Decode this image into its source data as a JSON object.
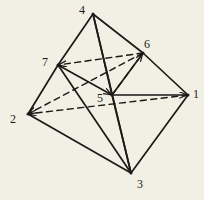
{
  "figure": {
    "name": "polyhedron-wireframe-diagram",
    "background_color": "#f2efe4",
    "ink_color": "#1a1a18",
    "canvas": {
      "width": 204,
      "height": 200
    },
    "vertices": [
      {
        "id": "1",
        "label": "1",
        "x": 188,
        "y": 95,
        "label_x": 193,
        "label_y": 88
      },
      {
        "id": "2",
        "label": "2",
        "x": 28,
        "y": 114,
        "label_x": 10,
        "label_y": 113
      },
      {
        "id": "3",
        "label": "3",
        "x": 131,
        "y": 173,
        "label_x": 137,
        "label_y": 178
      },
      {
        "id": "4",
        "label": "4",
        "x": 93,
        "y": 14,
        "label_x": 79,
        "label_y": 4
      },
      {
        "id": "5",
        "label": "5",
        "x": 112,
        "y": 95,
        "label_x": 97,
        "label_y": 92
      },
      {
        "id": "6",
        "label": "6",
        "x": 143,
        "y": 53,
        "label_x": 144,
        "label_y": 38
      },
      {
        "id": "7",
        "label": "7",
        "x": 58,
        "y": 65,
        "label_x": 42,
        "label_y": 56
      }
    ],
    "solid_edges": [
      {
        "from": "4",
        "to": "7",
        "arrow": "none"
      },
      {
        "from": "4",
        "to": "6",
        "arrow": "none"
      },
      {
        "from": "4",
        "to": "5",
        "arrow": "none"
      },
      {
        "from": "4",
        "to": "3",
        "arrow": "none"
      },
      {
        "from": "7",
        "to": "2",
        "arrow": "none"
      },
      {
        "from": "7",
        "to": "3",
        "arrow": "none"
      },
      {
        "from": "7",
        "to": "5",
        "arrow": "to"
      },
      {
        "from": "6",
        "to": "1",
        "arrow": "none"
      },
      {
        "from": "6",
        "to": "5",
        "arrow": "none"
      },
      {
        "from": "2",
        "to": "3",
        "arrow": "none"
      },
      {
        "from": "3",
        "to": "1",
        "arrow": "none"
      },
      {
        "from": "5",
        "to": "3",
        "arrow": "none"
      },
      {
        "from": "5",
        "to": "1",
        "arrow": "to"
      }
    ],
    "dashed_edges": [
      {
        "from": "6",
        "to": "7",
        "arrow": "to"
      },
      {
        "from": "5",
        "to": "6",
        "arrow": "to"
      },
      {
        "from": "6",
        "to": "2",
        "arrow": "to"
      },
      {
        "from": "1",
        "to": "2",
        "arrow": "to"
      }
    ]
  }
}
